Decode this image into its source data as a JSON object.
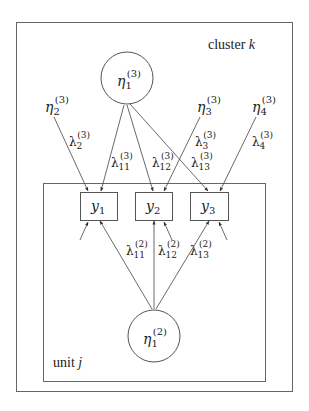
{
  "diagram": {
    "type": "multilevel-factor-model-path-diagram",
    "colors": {
      "line": "#555555",
      "text": "#222222",
      "background": "#ffffff"
    },
    "outer_box": {
      "label": "cluster",
      "label_var": "k"
    },
    "inner_box": {
      "label": "unit",
      "label_var": "j"
    },
    "latent_level3": {
      "symbol": "η",
      "sub": "1",
      "sup": "(3)"
    },
    "latent_level2": {
      "symbol": "η",
      "sub": "1",
      "sup": "(2)"
    },
    "specific_factors": [
      {
        "symbol": "η",
        "sub": "2",
        "sup": "(3)",
        "loading": {
          "symbol": "λ",
          "sub": "2",
          "sup": "(3)"
        }
      },
      {
        "symbol": "η",
        "sub": "3",
        "sup": "(3)",
        "loading": {
          "symbol": "λ",
          "sub": "3",
          "sup": "(3)"
        }
      },
      {
        "symbol": "η",
        "sub": "4",
        "sup": "(3)",
        "loading": {
          "symbol": "λ",
          "sub": "4",
          "sup": "(3)"
        }
      }
    ],
    "observed": [
      {
        "symbol": "y",
        "sub": "1"
      },
      {
        "symbol": "y",
        "sub": "2"
      },
      {
        "symbol": "y",
        "sub": "3"
      }
    ],
    "loadings_level3": [
      {
        "symbol": "λ",
        "sub": "11",
        "sup": "(3)"
      },
      {
        "symbol": "λ",
        "sub": "12",
        "sup": "(3)"
      },
      {
        "symbol": "λ",
        "sub": "13",
        "sup": "(3)"
      }
    ],
    "loadings_level2": [
      {
        "symbol": "λ",
        "sub": "11",
        "sup": "(2)"
      },
      {
        "symbol": "λ",
        "sub": "12",
        "sup": "(2)"
      },
      {
        "symbol": "λ",
        "sub": "13",
        "sup": "(2)"
      }
    ]
  }
}
